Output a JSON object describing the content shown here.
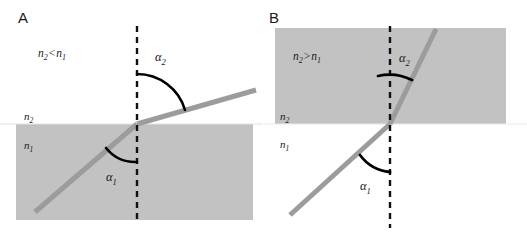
{
  "figure": {
    "width": 527,
    "height": 237,
    "background_color": "#ffffff",
    "medium_fill_color": "#c2c2c2",
    "ray_color": "#9c9c9c",
    "normal_line_color": "#111111",
    "arc_color": "#000000",
    "text_color": "#1a1a1a"
  },
  "panels": [
    {
      "id": "A",
      "letter": "A",
      "relation_label": {
        "n_left": "n",
        "n_left_sub": "2",
        "operator": "<",
        "n_right": "n",
        "n_right_sub": "1"
      },
      "upper_medium_label": {
        "symbol": "n",
        "sub": "2"
      },
      "lower_medium_label": {
        "symbol": "n",
        "sub": "1"
      },
      "incident_angle_label": {
        "symbol": "α",
        "sub": "1"
      },
      "refracted_angle_label": {
        "symbol": "α",
        "sub": "2"
      },
      "upper_medium_shaded": false,
      "lower_medium_shaded": true,
      "description": "Ray passes from denser medium n1 (lower, shaded) into less dense medium n2 (upper, white); refracted ray bends away from the normal so alpha2 is greater than alpha1."
    },
    {
      "id": "B",
      "letter": "B",
      "relation_label": {
        "n_left": "n",
        "n_left_sub": "2",
        "operator": ">",
        "n_right": "n",
        "n_right_sub": "1"
      },
      "upper_medium_label": {
        "symbol": "n",
        "sub": "2"
      },
      "lower_medium_label": {
        "symbol": "n",
        "sub": "1"
      },
      "incident_angle_label": {
        "symbol": "α",
        "sub": "1"
      },
      "refracted_angle_label": {
        "symbol": "α",
        "sub": "2"
      },
      "upper_medium_shaded": true,
      "lower_medium_shaded": false,
      "description": "Ray passes from less dense medium n1 (lower, white) into denser medium n2 (upper, shaded); refracted ray bends toward the normal so alpha2 is smaller than alpha1."
    }
  ]
}
